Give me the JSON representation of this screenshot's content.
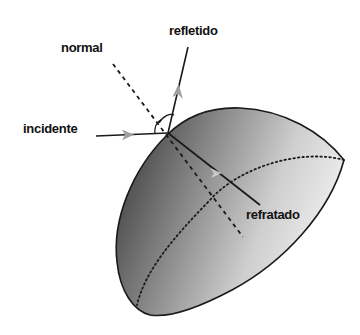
{
  "diagram": {
    "labels": {
      "normal": "normal",
      "reflected": "refletido",
      "incident": "incidente",
      "refracted": "refratado"
    },
    "colors": {
      "line": "#1a1a1a",
      "arrow": "#a0a0a0",
      "shape_dark": "#3a3a3a",
      "shape_light": "#e6e6e6",
      "background": "#ffffff"
    }
  }
}
